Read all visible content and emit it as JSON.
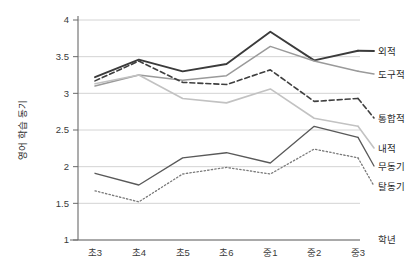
{
  "chart_data": {
    "type": "line",
    "title": "",
    "subtitle": "",
    "xlabel": "학년",
    "ylabel": "영어 학습 동기",
    "categories": [
      "초3",
      "초4",
      "초5",
      "초6",
      "중1",
      "중2",
      "중3"
    ],
    "ylim": [
      1,
      4
    ],
    "yticks": [
      "1",
      "1.5",
      "2",
      "2.5",
      "3",
      "3.5",
      "4"
    ],
    "ytick_values": [
      1,
      1.5,
      2,
      2.5,
      3,
      3.5,
      4
    ],
    "grid": "horizontal",
    "legend_position": "right-inline-end-of-line",
    "series": [
      {
        "name": "외적",
        "values": [
          3.22,
          3.46,
          3.3,
          3.4,
          3.84,
          3.45,
          3.58
        ],
        "color": "#3b3b3b",
        "style": "solid",
        "width": 1.9
      },
      {
        "name": "도구적",
        "values": [
          3.1,
          3.25,
          3.18,
          3.24,
          3.64,
          3.44,
          3.3
        ],
        "color": "#9a9a9a",
        "style": "solid",
        "width": 1.5
      },
      {
        "name": "통합적",
        "values": [
          3.17,
          3.44,
          3.15,
          3.12,
          3.32,
          2.89,
          2.93
        ],
        "color": "#3f3f3f",
        "style": "dashed",
        "width": 1.6
      },
      {
        "name": "내적",
        "values": [
          3.13,
          3.25,
          2.93,
          2.87,
          3.06,
          2.66,
          2.55
        ],
        "color": "#c2c2c2",
        "style": "solid",
        "width": 1.6
      },
      {
        "name": "무동기",
        "values": [
          1.91,
          1.75,
          2.12,
          2.19,
          2.05,
          2.55,
          2.4
        ],
        "color": "#595959",
        "style": "solid",
        "width": 1.3
      },
      {
        "name": "탈동기",
        "values": [
          1.67,
          1.52,
          1.9,
          1.99,
          1.9,
          2.24,
          2.12
        ],
        "color": "#7a7a7a",
        "style": "dotted",
        "width": 1.3
      }
    ],
    "legend_entries": [
      {
        "label": "외적",
        "y": 51
      },
      {
        "label": "도구적",
        "y": 74
      },
      {
        "label": "통합적",
        "y": 118
      },
      {
        "label": "내적",
        "y": 148
      },
      {
        "label": "무동기",
        "y": 166
      },
      {
        "label": "탈동기",
        "y": 186
      }
    ],
    "axis_color": "#6a6a6a",
    "grid_color": "#cfcfcf"
  }
}
